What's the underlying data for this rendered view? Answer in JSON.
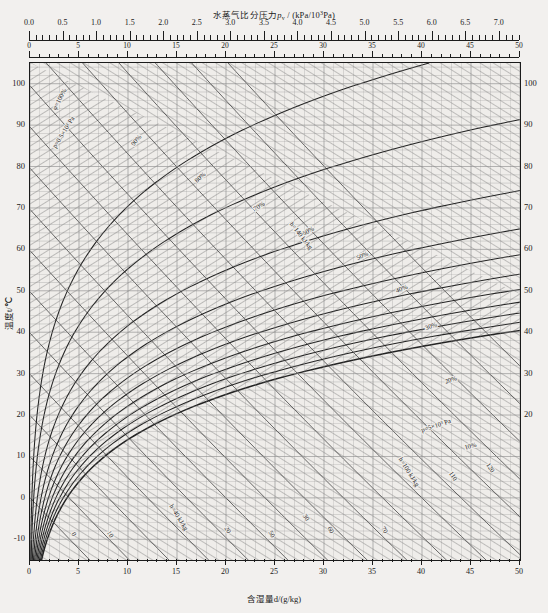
{
  "chart_data": {
    "type": "line",
    "title_main": "水蒸气比分压力",
    "title_sym": "p",
    "title_sub": "v",
    "title_unit_a": " / (kPa/10",
    "title_unit_sup": "3",
    "title_unit_b": "Pa)",
    "xlabel": "含湿量d/(g/kg)",
    "ylabel": "温度t/℃",
    "xlim": [
      0,
      50
    ],
    "ylim": [
      -15,
      105
    ],
    "grid": true,
    "legend_position": "in-plot-labels",
    "top_axis": {
      "name": "vapour-partial-pressure",
      "label": "水蒸气比分压力p_v / (kPa/10³Pa)",
      "range": [
        0.0,
        7.3
      ],
      "major_ticks": [
        0.0,
        0.5,
        1.0,
        1.5,
        2.0,
        2.5,
        3.0,
        3.5,
        4.0,
        4.5,
        5.0,
        5.5,
        6.0,
        6.5,
        7.0
      ],
      "tick_labels": [
        "0.0",
        "0.5",
        "1.0",
        "1.5",
        "2.0",
        "2.5",
        "3.0",
        "3.5",
        "4.0",
        "4.5",
        "5.0",
        "5.5",
        "6.0",
        "6.5",
        "7.0"
      ],
      "minor_per_major": 5
    },
    "second_top_axis": {
      "name": "moisture-content-top",
      "major_ticks": [
        0,
        5,
        10,
        15,
        20,
        25,
        30,
        35,
        40,
        45,
        50
      ],
      "tick_labels": [
        "0",
        "5",
        "10",
        "15",
        "20",
        "25",
        "30",
        "35",
        "40",
        "45",
        "50"
      ]
    },
    "y_axis": {
      "name": "temperature",
      "label": "温度t/℃",
      "major_ticks": [
        -10,
        0,
        10,
        20,
        30,
        40,
        50,
        60,
        70,
        80,
        90,
        100
      ],
      "tick_labels": [
        "-10",
        "0",
        "10",
        "20",
        "30",
        "40",
        "50",
        "60",
        "70",
        "80",
        "90",
        "100"
      ],
      "right_tick_labels": [
        "",
        "",
        "",
        "20",
        "30",
        "40",
        "50",
        "60",
        "70",
        "80",
        "90",
        "100"
      ]
    },
    "x_axis": {
      "name": "moisture-content",
      "label": "含湿量d/(g/kg)",
      "major_ticks": [
        0,
        5,
        10,
        15,
        20,
        25,
        30,
        35,
        40,
        45,
        50
      ],
      "tick_labels": [
        "0",
        "5",
        "10",
        "15",
        "20",
        "25",
        "30",
        "35",
        "40",
        "45",
        "50"
      ]
    },
    "series": [
      {
        "name": "relative-humidity",
        "label": "φ",
        "values_pct": [
          100,
          90,
          80,
          70,
          60,
          50,
          40,
          30,
          20,
          10,
          5
        ],
        "annotations": [
          "100%",
          "90%",
          "80%",
          "70%",
          "60%",
          "50%",
          "40%",
          "30%",
          "20%",
          "10%",
          "5%"
        ]
      },
      {
        "name": "enthalpy",
        "label": "h / (kJ/kg)",
        "values": [
          0,
          10,
          20,
          30,
          40,
          50,
          60,
          70,
          80,
          90,
          100,
          110,
          120,
          130,
          140,
          150,
          160
        ],
        "annotations": [
          "0",
          "10",
          "20",
          "30",
          "h=40 kJ/kg",
          "50",
          "60",
          "70",
          "80",
          "90",
          "h=100 kJ/kg",
          "110",
          "120",
          "130",
          "h=140 kJ/kg"
        ]
      },
      {
        "name": "vapour-pressure-lines",
        "label": "p_v",
        "annotations": [
          "p=0.5×10³ Pa",
          "p=1×10³ Pa",
          "p=2×10³ Pa",
          "p=3×10³ Pa",
          "p=4×10³ Pa",
          "p=5×10³ Pa"
        ]
      }
    ],
    "in_plot_annotations": [
      {
        "name": "phi-100",
        "text": "φ=100%",
        "x": 3.2,
        "y": 96,
        "rot": -62
      },
      {
        "name": "phi-90",
        "text": "90%",
        "x": 11.0,
        "y": 86,
        "rot": -50
      },
      {
        "name": "phi-80",
        "text": "80%",
        "x": 17.5,
        "y": 77,
        "rot": -42
      },
      {
        "name": "phi-70",
        "text": "70%",
        "x": 23.5,
        "y": 70,
        "rot": -34
      },
      {
        "name": "phi-60",
        "text": "60%",
        "x": 28.5,
        "y": 64,
        "rot": -30
      },
      {
        "name": "phi-50",
        "text": "50%",
        "x": 34.0,
        "y": 58,
        "rot": -26
      },
      {
        "name": "phi-40",
        "text": "40%",
        "x": 38.0,
        "y": 50,
        "rot": -22
      },
      {
        "name": "phi-30",
        "text": "30%",
        "x": 41.0,
        "y": 41,
        "rot": -20
      },
      {
        "name": "phi-20",
        "text": "20%",
        "x": 43.0,
        "y": 28,
        "rot": -18
      },
      {
        "name": "phi-10",
        "text": "10%",
        "x": 45.0,
        "y": 12,
        "rot": -15
      },
      {
        "name": "h-40",
        "text": "h=40 kJ/kg",
        "x": 15.0,
        "y": -5,
        "rot": 58
      },
      {
        "name": "h-100",
        "text": "h=100 kJ/kg",
        "x": 38.5,
        "y": 6,
        "rot": 58
      },
      {
        "name": "h-140",
        "text": "h=140 kJ/kg",
        "x": 27.5,
        "y": 63,
        "rot": 52
      },
      {
        "name": "p-05",
        "text": "p=0.5×10³ Pa",
        "x": 3.6,
        "y": 88,
        "rot": -58
      },
      {
        "name": "p-5",
        "text": "p=5×10³ Pa",
        "x": 41.5,
        "y": 17,
        "rot": -18
      },
      {
        "name": "h-0",
        "text": "0",
        "x": 4.3,
        "y": -9,
        "rot": 60
      },
      {
        "name": "h-10",
        "text": "10",
        "x": 8.0,
        "y": -9,
        "rot": 60
      },
      {
        "name": "h-20",
        "text": "20",
        "x": 20.0,
        "y": -8,
        "rot": 58
      },
      {
        "name": "h-30",
        "text": "30",
        "x": 28.0,
        "y": -5,
        "rot": 56
      },
      {
        "name": "h-50",
        "text": "50",
        "x": 24.5,
        "y": -9,
        "rot": 58
      },
      {
        "name": "h-60",
        "text": "60",
        "x": 30.5,
        "y": -8,
        "rot": 58
      },
      {
        "name": "h-70",
        "text": "70",
        "x": 36.0,
        "y": -8,
        "rot": 58
      },
      {
        "name": "h-110",
        "text": "110",
        "x": 43.0,
        "y": 5,
        "rot": 56
      },
      {
        "name": "h-120",
        "text": "120",
        "x": 46.8,
        "y": 7,
        "rot": 56
      }
    ]
  }
}
